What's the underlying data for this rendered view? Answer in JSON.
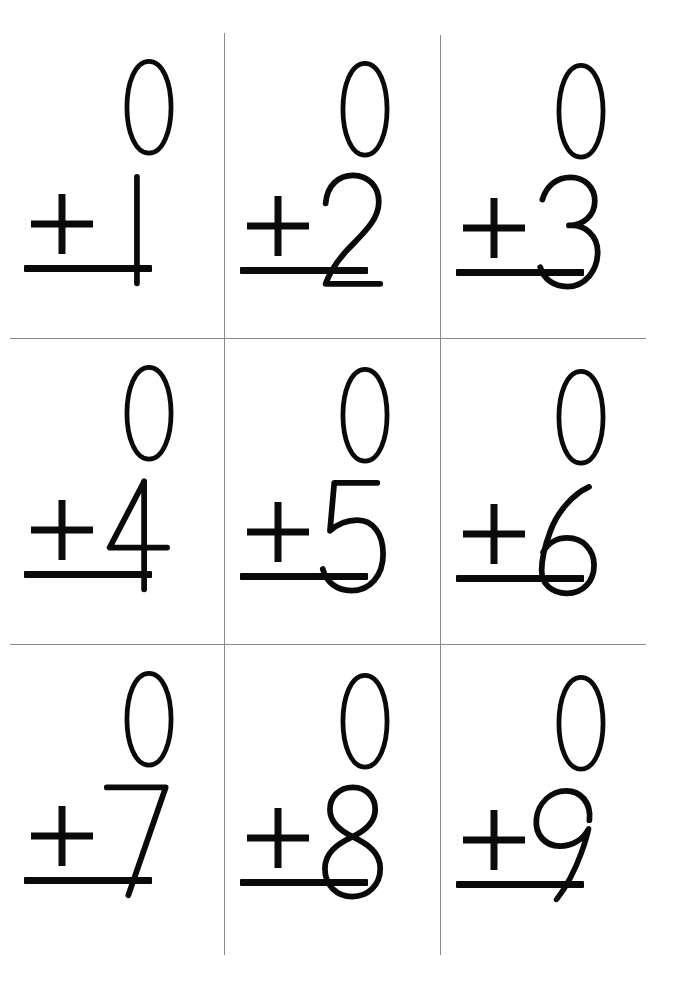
{
  "document": {
    "type": "math-flashcard-sheet",
    "title": "Addition Flashcards — Adding Zero",
    "background_color": "#ffffff",
    "ink_color": "#0a0a0a",
    "cutline_color": "#8a8a8a",
    "grid": {
      "rows": 3,
      "columns": 3,
      "cells": 9
    }
  },
  "operator": "+",
  "cells": [
    {
      "id": "card-0-plus-1",
      "top_addend": "0",
      "operator": "+",
      "bottom_addend": "1",
      "answer": "",
      "row": 1,
      "column": 1
    },
    {
      "id": "card-0-plus-2",
      "top_addend": "0",
      "operator": "+",
      "bottom_addend": "2",
      "answer": "",
      "row": 1,
      "column": 2
    },
    {
      "id": "card-0-plus-3",
      "top_addend": "0",
      "operator": "+",
      "bottom_addend": "3",
      "answer": "",
      "row": 1,
      "column": 3
    },
    {
      "id": "card-0-plus-4",
      "top_addend": "0",
      "operator": "+",
      "bottom_addend": "4",
      "answer": "",
      "row": 2,
      "column": 1
    },
    {
      "id": "card-0-plus-5",
      "top_addend": "0",
      "operator": "+",
      "bottom_addend": "5",
      "answer": "",
      "row": 2,
      "column": 2
    },
    {
      "id": "card-0-plus-6",
      "top_addend": "0",
      "operator": "+",
      "bottom_addend": "6",
      "answer": "",
      "row": 2,
      "column": 3
    },
    {
      "id": "card-0-plus-7",
      "top_addend": "0",
      "operator": "+",
      "bottom_addend": "7",
      "answer": "",
      "row": 3,
      "column": 1
    },
    {
      "id": "card-0-plus-8",
      "top_addend": "0",
      "operator": "+",
      "bottom_addend": "8",
      "answer": "",
      "row": 3,
      "column": 2
    },
    {
      "id": "card-0-plus-9",
      "top_addend": "0",
      "operator": "+",
      "bottom_addend": "9",
      "answer": "",
      "row": 3,
      "column": 3
    }
  ],
  "layout": {
    "cell_origins": [
      {
        "x": 10,
        "y": 36
      },
      {
        "x": 226,
        "y": 38
      },
      {
        "x": 442,
        "y": 40
      },
      {
        "x": 10,
        "y": 342
      },
      {
        "x": 226,
        "y": 344
      },
      {
        "x": 442,
        "y": 346
      },
      {
        "x": 10,
        "y": 648
      },
      {
        "x": 226,
        "y": 650
      },
      {
        "x": 442,
        "y": 652
      }
    ],
    "vertical_cutlines": [
      {
        "x": 224,
        "y": 33,
        "height": 922
      },
      {
        "x": 440,
        "y": 35,
        "height": 920
      }
    ],
    "horizontal_cutlines": [
      {
        "x": 10,
        "y": 338,
        "width": 636
      },
      {
        "x": 10,
        "y": 644,
        "width": 636
      }
    ]
  }
}
